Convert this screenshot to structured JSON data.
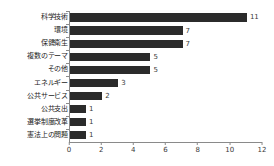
{
  "chart_data": {
    "type": "bar",
    "orientation": "horizontal",
    "title": "",
    "subtitle": "",
    "xlabel": "",
    "ylabel": "",
    "xlim": [
      0,
      12
    ],
    "xticks": [
      0,
      2,
      4,
      6,
      8,
      10,
      12
    ],
    "grid": false,
    "legend": null,
    "bar_color": "#2b2b2b",
    "axis_color": "#8a8a8a",
    "text_color": "#1a1a1a",
    "categories": [
      "科学技術",
      "環境",
      "保健衛生",
      "複数のテーマ",
      "その他",
      "エネルギー",
      "公共サービス",
      "公共支出",
      "選挙制度改革",
      "憲法上の問題"
    ],
    "values": [
      11,
      7,
      7,
      5,
      5,
      3,
      2,
      1,
      1,
      1
    ],
    "value_labels": [
      "11",
      "7",
      "7",
      "5",
      "5",
      "3",
      "2",
      "1",
      "1",
      "1"
    ],
    "xtick_labels": [
      "0",
      "2",
      "4",
      "6",
      "8",
      "10",
      "12"
    ]
  }
}
